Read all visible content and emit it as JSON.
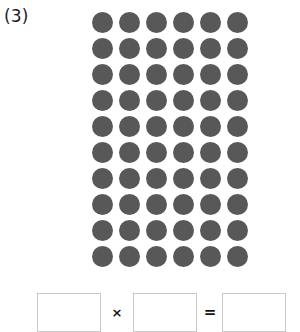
{
  "problem": {
    "label": "(3)"
  },
  "array": {
    "rows": 10,
    "columns": 6,
    "total_dots": 60,
    "dot_color": "#585858",
    "dot_shape": "circle"
  },
  "equation": {
    "factor_1": "",
    "factor_1_placeholder": "",
    "multiply_symbol": "×",
    "factor_2": "",
    "factor_2_placeholder": "",
    "equals_symbol": "=",
    "product": "",
    "product_placeholder": "",
    "box_border_color": "#c9c9c9"
  },
  "chart_data": {
    "type": "scatter",
    "title": "(3)",
    "rows": 10,
    "columns": 6,
    "values": [
      [
        1,
        1,
        1,
        1,
        1,
        1
      ],
      [
        1,
        1,
        1,
        1,
        1,
        1
      ],
      [
        1,
        1,
        1,
        1,
        1,
        1
      ],
      [
        1,
        1,
        1,
        1,
        1,
        1
      ],
      [
        1,
        1,
        1,
        1,
        1,
        1
      ],
      [
        1,
        1,
        1,
        1,
        1,
        1
      ],
      [
        1,
        1,
        1,
        1,
        1,
        1
      ],
      [
        1,
        1,
        1,
        1,
        1,
        1
      ],
      [
        1,
        1,
        1,
        1,
        1,
        1
      ],
      [
        1,
        1,
        1,
        1,
        1,
        1
      ]
    ],
    "total": 60,
    "xlabel": "",
    "ylabel": "",
    "grid": false
  }
}
